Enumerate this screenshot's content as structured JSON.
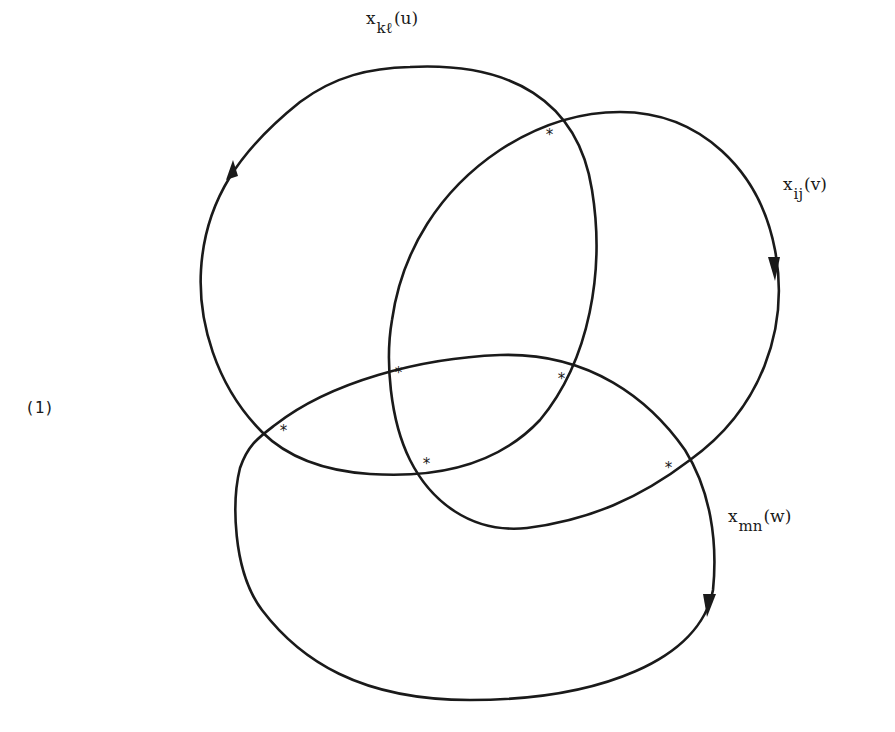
{
  "equation_number": "(1)",
  "curves": [
    {
      "id": "u",
      "base": "x",
      "subscript": "kℓ",
      "argument": "(u)",
      "orientation": "counterclockwise arrow on left side pointing up"
    },
    {
      "id": "v",
      "base": "x",
      "subscript": "ij",
      "argument": "(v)",
      "orientation": "clockwise arrow on right side pointing down"
    },
    {
      "id": "w",
      "base": "x",
      "subscript": "mn",
      "argument": "(w)",
      "orientation": "clockwise arrow on right side pointing down"
    }
  ],
  "crossing_marker": "*",
  "crossings": [
    {
      "between": "u-v",
      "x": 552,
      "y": 124
    },
    {
      "between": "v-w",
      "x": 400,
      "y": 372
    },
    {
      "between": "u-w",
      "x": 563,
      "y": 378
    },
    {
      "between": "u-w",
      "x": 285,
      "y": 430
    },
    {
      "between": "u-v",
      "x": 428,
      "y": 463
    },
    {
      "between": "v-w",
      "x": 670,
      "y": 467
    }
  ]
}
